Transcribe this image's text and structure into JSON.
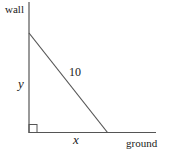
{
  "diagram": {
    "labels": {
      "wall": "wall",
      "ground": "ground",
      "hypotenuse": "10",
      "vertical": "y",
      "horizontal": "x"
    },
    "colors": {
      "line": "#555555",
      "text": "#1a1a1a",
      "background": "#ffffff"
    }
  }
}
